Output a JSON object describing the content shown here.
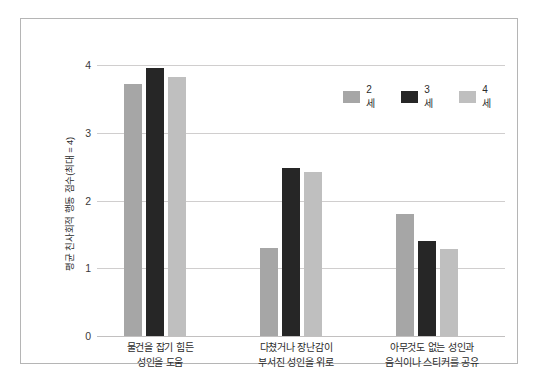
{
  "chart_data": {
    "type": "bar",
    "title": "",
    "subtitle": "",
    "xlabel": "",
    "ylabel": "평균 친사회적 행동 점수(최대 = 4)",
    "ylim": [
      0,
      4
    ],
    "yticks": [
      "4",
      "3",
      "2",
      "1",
      "0"
    ],
    "ytick_values": [
      4,
      3,
      2,
      1,
      0
    ],
    "grid": true,
    "legend_position": "top-right",
    "categories": [
      "물건을 잡기 힘든\n성인을 도움",
      "다쳤거나 장난감이\n부서진 성인을 위로",
      "아무것도 없는 성인과\n음식이나 스티커를 공유"
    ],
    "category_lines": [
      [
        "물건을 잡기 힘든",
        "성인을 도움"
      ],
      [
        "다쳤거나 장난감이",
        "부서진 성인을 위로"
      ],
      [
        "아무것도 없는 성인과",
        "음식이나 스티커를 공유"
      ]
    ],
    "series": [
      {
        "name": "2세",
        "color": "#a6a6a6",
        "values": [
          3.72,
          1.3,
          1.8
        ]
      },
      {
        "name": "3세",
        "color": "#262626",
        "values": [
          3.95,
          2.48,
          1.4
        ]
      },
      {
        "name": "4세",
        "color": "#bfbfbf",
        "values": [
          3.82,
          2.42,
          1.28
        ]
      }
    ]
  },
  "figure": {
    "border_color": "#b5b5b5",
    "background": "#ffffff",
    "gridline_color": "#d0cece"
  }
}
